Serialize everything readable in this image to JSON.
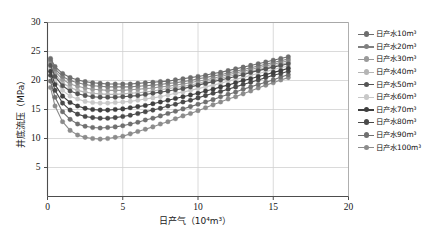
{
  "chart_data": {
    "type": "line",
    "title": "",
    "xlabel": "日产气（10⁴m³）",
    "ylabel": "井底流压（MPa）",
    "xlim": [
      0,
      20
    ],
    "ylim": [
      0,
      30
    ],
    "xticks": [
      0,
      5,
      10,
      15,
      20
    ],
    "yticks": [
      5,
      10,
      15,
      20,
      25,
      30
    ],
    "grid": true,
    "legend_position": "right",
    "x": [
      0.2,
      0.5,
      1,
      1.5,
      2,
      2.5,
      3,
      3.5,
      4,
      4.5,
      5,
      5.5,
      6,
      6.5,
      7,
      7.5,
      8,
      8.5,
      9,
      9.5,
      10,
      10.5,
      11,
      11.5,
      12,
      12.5,
      13,
      13.5,
      14,
      14.5,
      15,
      15.5,
      16
    ],
    "series": [
      {
        "name": "日产水10m³",
        "color": "#6e6e6e",
        "values": [
          23.8,
          22.4,
          21.2,
          20.5,
          20.1,
          19.8,
          19.6,
          19.5,
          19.4,
          19.4,
          19.4,
          19.4,
          19.5,
          19.6,
          19.7,
          19.8,
          19.9,
          20.1,
          20.3,
          20.5,
          20.7,
          20.9,
          21.2,
          21.4,
          21.7,
          22.0,
          22.3,
          22.6,
          22.9,
          23.2,
          23.5,
          23.8,
          24.1
        ]
      },
      {
        "name": "日产水20m³",
        "color": "#808080",
        "values": [
          23.5,
          22.0,
          20.7,
          20.0,
          19.6,
          19.3,
          19.1,
          19.0,
          18.9,
          18.9,
          18.9,
          18.9,
          19.0,
          19.1,
          19.2,
          19.3,
          19.5,
          19.6,
          19.8,
          20.0,
          20.3,
          20.5,
          20.8,
          21.0,
          21.3,
          21.6,
          21.9,
          22.2,
          22.5,
          22.8,
          23.1,
          23.4,
          23.7
        ]
      },
      {
        "name": "日产水30m³",
        "color": "#9a9a9a",
        "values": [
          23.2,
          21.6,
          20.2,
          19.4,
          19.0,
          18.7,
          18.5,
          18.4,
          18.3,
          18.3,
          18.3,
          18.4,
          18.5,
          18.6,
          18.7,
          18.9,
          19.0,
          19.2,
          19.4,
          19.6,
          19.9,
          20.1,
          20.4,
          20.7,
          21.0,
          21.3,
          21.6,
          21.9,
          22.2,
          22.5,
          22.8,
          23.1,
          23.4
        ]
      },
      {
        "name": "日产水40m³",
        "color": "#b5b5b5",
        "values": [
          22.9,
          21.1,
          19.6,
          18.8,
          18.3,
          18.0,
          17.8,
          17.7,
          17.6,
          17.6,
          17.7,
          17.8,
          17.9,
          18.0,
          18.2,
          18.4,
          18.6,
          18.8,
          19.0,
          19.2,
          19.5,
          19.8,
          20.1,
          20.4,
          20.7,
          21.0,
          21.3,
          21.6,
          21.9,
          22.2,
          22.5,
          22.8,
          23.1
        ]
      },
      {
        "name": "日产水50m³",
        "color": "#555555",
        "values": [
          22.6,
          20.7,
          19.1,
          18.2,
          17.7,
          17.4,
          17.2,
          17.1,
          17.1,
          17.1,
          17.2,
          17.3,
          17.4,
          17.6,
          17.8,
          18.0,
          18.2,
          18.4,
          18.6,
          18.9,
          19.2,
          19.5,
          19.8,
          20.1,
          20.4,
          20.7,
          21.0,
          21.4,
          21.7,
          22.0,
          22.3,
          22.6,
          22.9
        ]
      },
      {
        "name": "日产水60m³",
        "color": "#c8c8c8",
        "values": [
          22.2,
          20.1,
          18.3,
          17.3,
          16.8,
          16.4,
          16.2,
          16.1,
          16.1,
          16.2,
          16.3,
          16.4,
          16.6,
          16.8,
          17.0,
          17.2,
          17.5,
          17.8,
          18.0,
          18.3,
          18.6,
          18.9,
          19.2,
          19.5,
          19.9,
          20.2,
          20.5,
          20.9,
          21.2,
          21.5,
          21.9,
          22.2,
          22.5
        ]
      },
      {
        "name": "日产水70m³",
        "color": "#3f3f3f",
        "values": [
          21.6,
          19.3,
          17.3,
          16.2,
          15.6,
          15.2,
          15.0,
          14.9,
          14.9,
          15.0,
          15.1,
          15.3,
          15.5,
          15.7,
          16.0,
          16.3,
          16.6,
          16.9,
          17.2,
          17.5,
          17.8,
          18.2,
          18.5,
          18.9,
          19.2,
          19.6,
          20.0,
          20.3,
          20.7,
          21.0,
          21.4,
          21.7,
          22.1
        ]
      },
      {
        "name": "日产水80m³",
        "color": "#4a4a4a",
        "values": [
          20.9,
          18.3,
          16.1,
          14.9,
          14.2,
          13.8,
          13.6,
          13.5,
          13.5,
          13.6,
          13.8,
          14.0,
          14.3,
          14.6,
          14.9,
          15.2,
          15.6,
          15.9,
          16.3,
          16.6,
          17.0,
          17.4,
          17.8,
          18.1,
          18.5,
          18.9,
          19.3,
          19.7,
          20.1,
          20.5,
          20.9,
          21.2,
          21.6
        ]
      },
      {
        "name": "日产水90m³",
        "color": "#707070",
        "values": [
          19.9,
          17.1,
          14.6,
          13.3,
          12.5,
          12.1,
          11.9,
          11.8,
          11.9,
          12.0,
          12.2,
          12.5,
          12.8,
          13.2,
          13.5,
          13.9,
          14.3,
          14.7,
          15.1,
          15.5,
          15.9,
          16.3,
          16.7,
          17.2,
          17.6,
          18.0,
          18.5,
          18.9,
          19.3,
          19.7,
          20.1,
          20.6,
          21.0
        ]
      },
      {
        "name": "日产水100m³",
        "color": "#8c8c8c",
        "values": [
          18.8,
          15.6,
          12.9,
          11.4,
          10.6,
          10.2,
          10.0,
          9.9,
          10.0,
          10.2,
          10.4,
          10.8,
          11.2,
          11.6,
          12.0,
          12.5,
          12.9,
          13.4,
          13.9,
          14.3,
          14.8,
          15.3,
          15.8,
          16.3,
          16.8,
          17.2,
          17.7,
          18.2,
          18.7,
          19.2,
          19.6,
          20.1,
          20.5
        ]
      }
    ]
  },
  "axes": {
    "xtick_labels": [
      "0",
      "5",
      "10",
      "15",
      "20"
    ],
    "ytick_labels": [
      "5",
      "10",
      "15",
      "20",
      "25",
      "30"
    ]
  }
}
